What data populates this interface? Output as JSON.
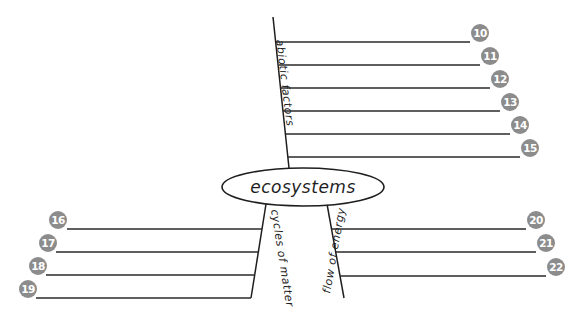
{
  "diagram": {
    "center": {
      "label": "ecosystems"
    },
    "branches": [
      {
        "id": "abiotic",
        "label": "abiotic factors",
        "blanks": [
          {
            "number": "10"
          },
          {
            "number": "11"
          },
          {
            "number": "12"
          },
          {
            "number": "13"
          },
          {
            "number": "14"
          },
          {
            "number": "15"
          }
        ]
      },
      {
        "id": "cycles",
        "label": "cycles of matter",
        "blanks": [
          {
            "number": "16"
          },
          {
            "number": "17"
          },
          {
            "number": "18"
          },
          {
            "number": "19"
          }
        ]
      },
      {
        "id": "energy",
        "label": "flow of energy",
        "blanks": [
          {
            "number": "20"
          },
          {
            "number": "21"
          },
          {
            "number": "22"
          }
        ]
      }
    ],
    "colors": {
      "line": "#1e1e1e",
      "number_badge": "#8c8c8c",
      "number_text": "#ffffff"
    }
  }
}
